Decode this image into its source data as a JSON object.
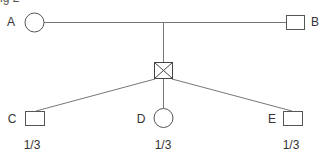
{
  "figure": {
    "caption": "ig 2",
    "line_color": "#666666",
    "shape_stroke": "#555555"
  },
  "parents": [
    {
      "id": "A",
      "label": "A",
      "shape": "circle"
    },
    {
      "id": "B",
      "label": "B",
      "shape": "square"
    }
  ],
  "mating_node": {
    "shape": "crossed-box"
  },
  "children": [
    {
      "id": "C",
      "label": "C",
      "shape": "square",
      "probability": "1/3"
    },
    {
      "id": "D",
      "label": "D",
      "shape": "circle",
      "probability": "1/3"
    },
    {
      "id": "E",
      "label": "E",
      "shape": "square",
      "probability": "1/3"
    }
  ]
}
